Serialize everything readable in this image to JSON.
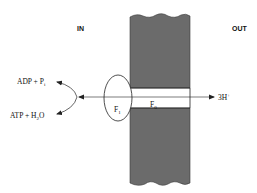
{
  "diagram": {
    "regions": {
      "inside_label": "IN",
      "outside_label": "OUT"
    },
    "complex": {
      "f1": {
        "base": "F",
        "sub": "1"
      },
      "f0": {
        "base": "F",
        "sub": "0"
      }
    },
    "reactants": {
      "adp": {
        "text": "ADP + P",
        "sub": "i"
      },
      "atp": {
        "text": "ATP + H",
        "sub": "2",
        "tail": "O"
      }
    },
    "protons": {
      "text": "3H",
      "sup": "+"
    },
    "colors": {
      "membrane": "#6b6b6b",
      "line": "#222222",
      "background": "#ffffff"
    }
  }
}
